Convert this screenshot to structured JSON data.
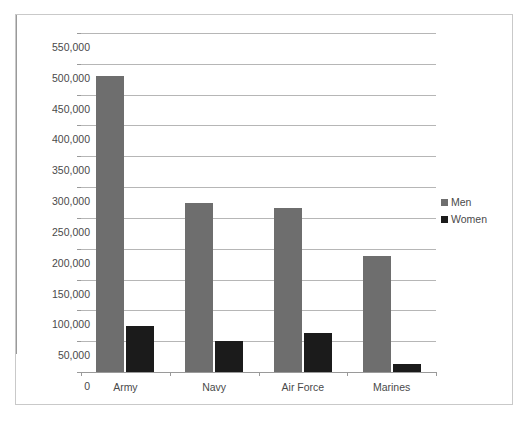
{
  "chart_data": {
    "type": "bar",
    "title": "",
    "xlabel": "",
    "ylabel": "",
    "categories": [
      "Army",
      "Navy",
      "Air Force",
      "Marines"
    ],
    "series": [
      {
        "name": "Men",
        "color": "#6e6e6e",
        "values": [
          480000,
          275000,
          266000,
          188000
        ]
      },
      {
        "name": "Women",
        "color": "#1b1b1b",
        "values": [
          75000,
          51000,
          64000,
          13000
        ]
      }
    ],
    "ylim": [
      0,
      550000
    ],
    "ytick_step": 50000,
    "ytick_labels": [
      "550,000",
      "500,000",
      "450,000",
      "400,000",
      "350,000",
      "300,000",
      "250,000",
      "200,000",
      "150,000",
      "100,000",
      "50,000",
      "0"
    ],
    "ytick_values": [
      550000,
      500000,
      450000,
      400000,
      350000,
      300000,
      250000,
      200000,
      150000,
      100000,
      50000,
      0
    ],
    "grid": true,
    "legend_position": "right",
    "legend_entries": [
      "Men",
      "Women"
    ]
  },
  "legend": {
    "men_label": "Men",
    "women_label": "Women"
  },
  "axes": {
    "y": {
      "t0": "550,000",
      "t1": "500,000",
      "t2": "450,000",
      "t3": "400,000",
      "t4": "350,000",
      "t5": "300,000",
      "t6": "250,000",
      "t7": "200,000",
      "t8": "150,000",
      "t9": "100,000",
      "t10": "50,000",
      "t11": "0"
    },
    "x": {
      "c0": "Army",
      "c1": "Navy",
      "c2": "Air Force",
      "c3": "Marines"
    }
  }
}
